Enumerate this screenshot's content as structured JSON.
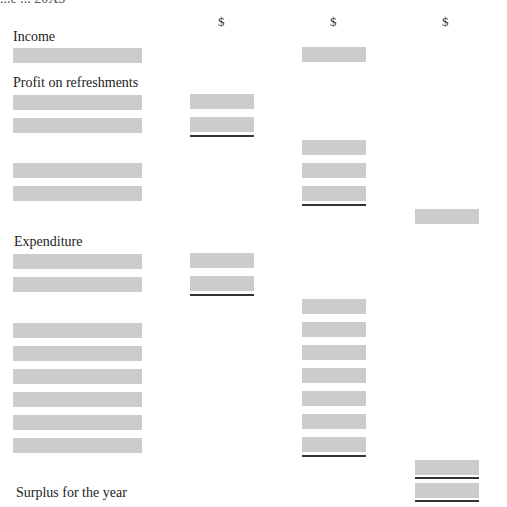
{
  "document": {
    "clipped_title": "...e ... 20X3",
    "currency_headers": [
      "$",
      "$",
      "$"
    ],
    "sections": {
      "income": "Income",
      "refreshments": "Profit on refreshments",
      "expenditure": "Expenditure",
      "surplus": "Surplus for the year"
    },
    "box_color": "#cccccc",
    "rule_color": "#333333"
  }
}
